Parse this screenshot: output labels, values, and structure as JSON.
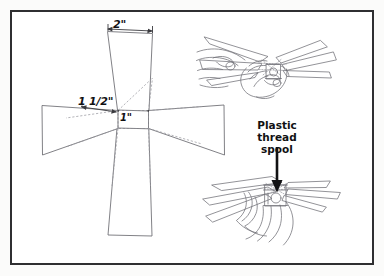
{
  "page": {
    "background_color": "#ffffff",
    "frame_color": "#2f2f31",
    "ink_color": "#5a5a60",
    "text_color": "#111113"
  },
  "pattern": {
    "name": "paper pinwheel cross template",
    "labels": {
      "width_top": "2\"",
      "arm_length": "1 1/2\"",
      "center_square": "1\""
    },
    "notes": {
      "center": "dashed 1 inch square at the intersection",
      "arms": "four tapered arms forming a cross",
      "fold_lines": "dashed diagonals from center square corners to arm corners"
    }
  },
  "illustrations": [
    {
      "name": "hands-assembling-pinwheel",
      "position": "top-right",
      "description": "Two hands pressing the folded pinwheel blades onto the spool"
    },
    {
      "name": "hand-holding-spool",
      "position": "bottom-right",
      "description": "Hand gripping the plastic thread spool under the assembled pinwheel"
    }
  ],
  "callout": {
    "label_lines": [
      "Plastic",
      "thread",
      "spool"
    ],
    "arrow": "down-arrow pointing to the spool"
  }
}
